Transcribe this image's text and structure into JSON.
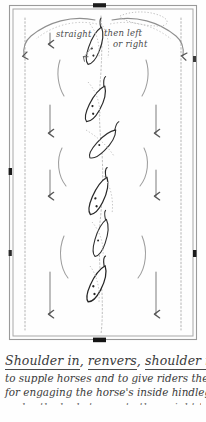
{
  "diagram": {
    "title_kind": "dressage-arena-schematic",
    "view": "birds-eye",
    "annotations": {
      "straight": "straight",
      "then_left": "then left",
      "or_right": "or right"
    },
    "markers": {
      "top_center": "",
      "bottom_center": "",
      "left_mid": "",
      "right_mid": ""
    },
    "colors": {
      "ink": "#2b2b2b",
      "pencil": "#8a8a8a",
      "paper": "#fefefe",
      "marker": "#1a1a1a"
    },
    "horses": [
      {
        "index": 1,
        "position": "centerline-top",
        "lean": "right"
      },
      {
        "index": 2,
        "position": "centerline-upper",
        "lean": "right"
      },
      {
        "index": 3,
        "position": "centerline-middle-upper",
        "lean": "right"
      },
      {
        "index": 4,
        "position": "centerline-middle-lower",
        "lean": "right"
      },
      {
        "index": 5,
        "position": "centerline-lower",
        "lean": "right"
      },
      {
        "index": 6,
        "position": "centerline-bottom",
        "lean": "right"
      }
    ],
    "arrow_count_left": 3,
    "arrow_count_right": 3
  },
  "caption": {
    "line1_a": "Shoulder in",
    "line1_sep1": ", ",
    "line1_b": "renvers",
    "line1_sep2": ", ",
    "line1_c": "shoulder in",
    "line1_tail": " ~",
    "line2": "to supple horses and to give riders the feel",
    "line3": "for engaging the horse's inside hindleg forward",
    "line4": "under the body to create the weight-taking ability"
  }
}
